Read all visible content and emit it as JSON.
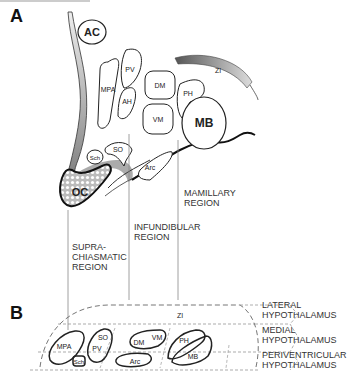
{
  "panels": {
    "a": {
      "label": "A"
    },
    "b": {
      "label": "B"
    }
  },
  "panel_a": {
    "nuclei": {
      "ac": "AC",
      "pv": "PV",
      "mpa": "MPA",
      "ah": "AH",
      "dm": "DM",
      "vm": "VM",
      "ph": "PH",
      "mb": "MB",
      "zi": "ZI",
      "sch": "Sch",
      "so": "SO",
      "arc": "Arc",
      "oc": "OC"
    },
    "regions": {
      "suprachiasmatic": [
        "SUPRA-",
        "CHIASMATIC",
        "REGION"
      ],
      "infundibular": [
        "INFUNDIBULAR",
        "REGION"
      ],
      "mamillary": [
        "MAMILLARY",
        "REGION"
      ]
    }
  },
  "panel_b": {
    "nuclei": {
      "mpa": "MPA",
      "so": "SO",
      "pv": "PV",
      "sch": "Sch",
      "dm": "DM",
      "vm": "VM",
      "arc": "Arc",
      "zi": "ZI",
      "ph": "PH",
      "mb": "MB"
    },
    "zones": {
      "lateral": [
        "LATERAL",
        "HYPOTHALAMUS"
      ],
      "medial": [
        "MEDIAL",
        "HYPOTHALAMUS"
      ],
      "periventricular": [
        "PERIVENTRICULAR",
        "HYPOTHALAMUS"
      ]
    }
  }
}
